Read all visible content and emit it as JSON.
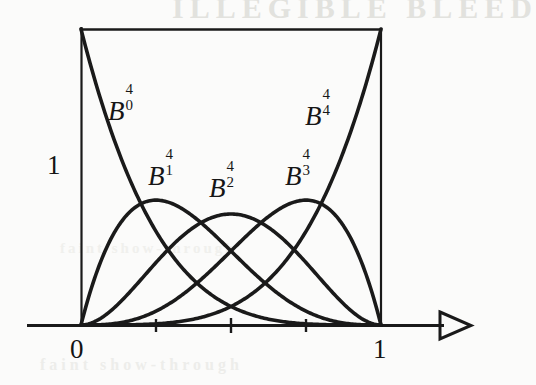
{
  "figure": {
    "kind": "scanned-mathematical-plot",
    "ink_color": "#161616",
    "paper_color": "#fbfbfa",
    "bleedthrough": {
      "top": "ILLEGIBLE BLEED",
      "middle": "faint show-through",
      "bottom": "faint show-through"
    }
  },
  "axes": {
    "x_label_left": "0",
    "x_label_right": "1",
    "y_label_top": "1",
    "x_tick_values": [
      0.25,
      0.5,
      0.75
    ],
    "x_arrowhead": "open-triangle-right",
    "x_axis_pixel_y": 325,
    "x_origin_pixel": 81,
    "x_one_pixel": 381,
    "y_one_pixel": 29
  },
  "curve_labels": [
    {
      "name": "B-0-4",
      "base": "B",
      "sup": "4",
      "sub": "0",
      "x": 108,
      "y": 95
    },
    {
      "name": "B-1-4",
      "base": "B",
      "sup": "4",
      "sub": "1",
      "x": 148,
      "y": 160
    },
    {
      "name": "B-2-4",
      "base": "B",
      "sup": "4",
      "sub": "2",
      "x": 209,
      "y": 172
    },
    {
      "name": "B-3-4",
      "base": "B",
      "sup": "4",
      "sub": "3",
      "x": 285,
      "y": 160
    },
    {
      "name": "B-4-4",
      "base": "B",
      "sup": "4",
      "sub": "4",
      "x": 305,
      "y": 100
    }
  ],
  "chart_data": {
    "type": "line",
    "title": "",
    "xlabel": "",
    "ylabel": "",
    "xlim": [
      0,
      1
    ],
    "ylim": [
      0,
      1
    ],
    "grid": false,
    "legend": "inline-curve-labels",
    "x": [
      0,
      0.05,
      0.1,
      0.15,
      0.2,
      0.25,
      0.3,
      0.35,
      0.4,
      0.45,
      0.5,
      0.55,
      0.6,
      0.65,
      0.7,
      0.75,
      0.8,
      0.85,
      0.9,
      0.95,
      1
    ],
    "series": [
      {
        "name": "B_0^4",
        "formula": "(1-t)^4",
        "peak_x": 0,
        "peak_y": 1,
        "values": [
          1,
          0.8145,
          0.6561,
          0.522,
          0.4096,
          0.3164,
          0.2401,
          0.1785,
          0.1296,
          0.0915,
          0.0625,
          0.041,
          0.0256,
          0.015,
          0.0081,
          0.0039,
          0.0016,
          0.0005,
          0.0001,
          0.0,
          0
        ]
      },
      {
        "name": "B_1^4",
        "formula": "4t(1-t)^3",
        "peak_x": 0.25,
        "peak_y": 0.4219,
        "values": [
          0,
          0.1715,
          0.2916,
          0.3685,
          0.4096,
          0.4219,
          0.4116,
          0.3845,
          0.3456,
          0.2995,
          0.25,
          0.2005,
          0.1536,
          0.1115,
          0.0756,
          0.0469,
          0.0256,
          0.0115,
          0.0036,
          0.0005,
          0
        ]
      },
      {
        "name": "B_2^4",
        "formula": "6t^2(1-t)^2",
        "peak_x": 0.5,
        "peak_y": 0.375,
        "values": [
          0,
          0.0135,
          0.0486,
          0.0975,
          0.1536,
          0.2109,
          0.2646,
          0.3105,
          0.3456,
          0.3675,
          0.375,
          0.3675,
          0.3456,
          0.3105,
          0.2646,
          0.2109,
          0.1536,
          0.0975,
          0.0486,
          0.0135,
          0
        ]
      },
      {
        "name": "B_3^4",
        "formula": "4t^3(1-t)",
        "peak_x": 0.75,
        "peak_y": 0.4219,
        "values": [
          0,
          0.0005,
          0.0036,
          0.0115,
          0.0256,
          0.0469,
          0.0756,
          0.1115,
          0.1536,
          0.2005,
          0.25,
          0.2995,
          0.3456,
          0.3845,
          0.4116,
          0.4219,
          0.4096,
          0.3685,
          0.2916,
          0.1715,
          0
        ]
      },
      {
        "name": "B_4^4",
        "formula": "t^4",
        "peak_x": 1,
        "peak_y": 1,
        "values": [
          0,
          0.0,
          0.0001,
          0.0005,
          0.0016,
          0.0039,
          0.0081,
          0.015,
          0.0256,
          0.041,
          0.0625,
          0.0915,
          0.1296,
          0.1785,
          0.2401,
          0.3164,
          0.4096,
          0.522,
          0.6561,
          0.8145,
          1
        ]
      }
    ],
    "annotations": [
      {
        "text": "1",
        "position": "y-axis-top-left"
      },
      {
        "text": "0",
        "position": "x-axis-origin"
      },
      {
        "text": "1",
        "position": "x-axis-one"
      }
    ]
  }
}
